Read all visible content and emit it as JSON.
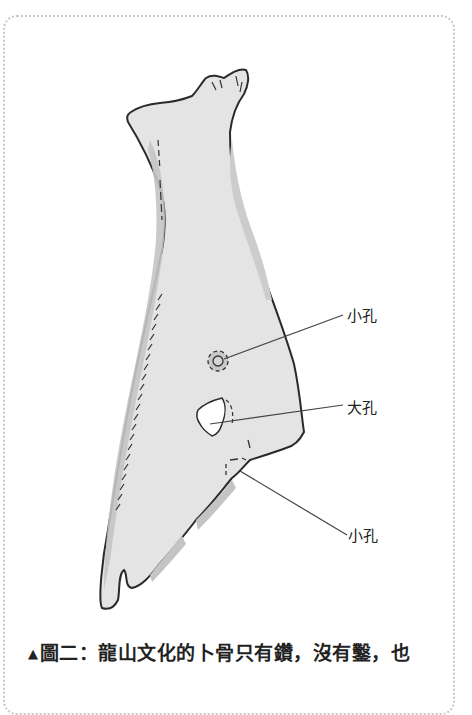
{
  "figure": {
    "annotations": [
      {
        "text": "小孔",
        "target": "upper small hole"
      },
      {
        "text": "大孔",
        "target": "large hole"
      },
      {
        "text": "小孔",
        "target": "lower small hole"
      }
    ],
    "colors": {
      "bone_fill": "#e4e4e4",
      "bone_shade": "#c4c4c4",
      "outline": "#2a2a2a",
      "frame_border": "#c8c8c8"
    }
  },
  "caption": {
    "marker": "▲",
    "text": "圖二：龍山文化的卜骨只有鑽，沒有鑿，也"
  }
}
